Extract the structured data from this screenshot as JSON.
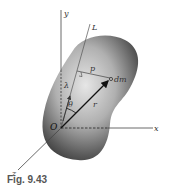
{
  "figure": {
    "caption": "Fig. 9.43",
    "labels": {
      "y_axis": "y",
      "x_axis": "x",
      "z_axis": "z",
      "line": "L",
      "origin": "O",
      "distance": "p",
      "mass_element": "dm",
      "unit_vector": "λ",
      "angle": "θ",
      "position_vector": "r"
    },
    "colors": {
      "body_dark": "#3a3a3a",
      "body_light": "#d8d8d8",
      "line": "#444444",
      "vector": "#111111"
    }
  }
}
